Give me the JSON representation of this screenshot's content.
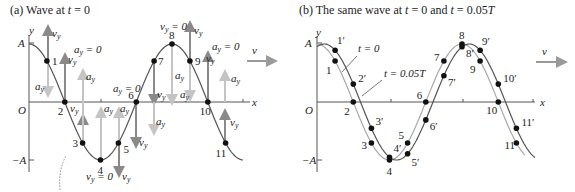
{
  "panel_a": {
    "title_prefix": "(a) Wave at ",
    "title_var": "t",
    "title_suffix": " = 0",
    "axis_y": "y",
    "axis_x": "x",
    "label_A": "A",
    "label_negA": "−A",
    "label_O": "O",
    "velocity_label": "v",
    "points": [
      "1",
      "2",
      "3",
      "4",
      "5",
      "6",
      "7",
      "8",
      "9",
      "10",
      "11"
    ],
    "vy": "v",
    "ay": "a",
    "sub_y": "y",
    "eq_zero": " = 0"
  },
  "panel_b": {
    "title_prefix": "(b) The same wave at ",
    "title_var1": "t",
    "title_mid": " = 0 and ",
    "title_var2": "t",
    "title_suffix": " = 0.05",
    "title_T": "T",
    "axis_y": "y",
    "axis_x": "x",
    "label_A": "A",
    "label_negA": "−A",
    "label_O": "O",
    "velocity_label": "v",
    "curve_t0_label": "t = 0",
    "curve_t1_label": "t = 0.05T",
    "points_t0": [
      "1",
      "2",
      "3",
      "4",
      "5",
      "6",
      "7",
      "8",
      "9",
      "10",
      "11"
    ],
    "points_t1": [
      "1′",
      "2′",
      "3′",
      "4′",
      "5′",
      "6′",
      "7′",
      "8′",
      "9′",
      "10′",
      "11′"
    ]
  },
  "colors": {
    "curve_dark": "#555555",
    "curve_light": "#9a9a9a",
    "arrow_dark": "#8a8a8a",
    "arrow_light": "#c4c4c4",
    "point": "#111111",
    "text": "#222222"
  }
}
